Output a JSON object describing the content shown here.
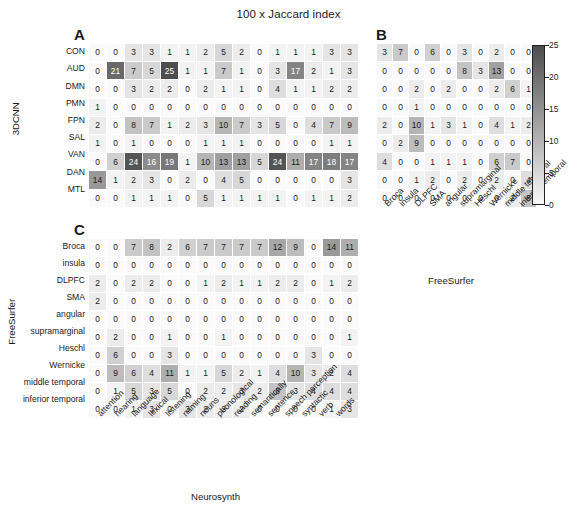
{
  "figure": {
    "title": "100 x Jaccard index"
  },
  "colorbar": {
    "name": "jaccard-colorbar",
    "ticks": [
      "0",
      "5",
      "10",
      "15",
      "20",
      "25"
    ],
    "vmin": 0,
    "vmax": 25,
    "low_color": "#ffffff",
    "high_color": "#4d4d4d"
  },
  "panels": [
    {
      "letter": "A",
      "ylabel": "3DCNN",
      "xlabel": "",
      "rows": [
        "CON",
        "AUD",
        "DMN",
        "PMN",
        "FPN",
        "SAL",
        "VAN",
        "DAN",
        "MTL"
      ],
      "cols": [
        "attention",
        "hearing",
        "language",
        "lexical",
        "listening",
        "naming",
        "nouns",
        "phonological",
        "reading",
        "semantically",
        "sentence",
        "speech perception",
        "syntactic",
        "verb",
        "words"
      ],
      "values": [
        [
          0,
          0,
          3,
          3,
          1,
          1,
          2,
          5,
          2,
          0,
          1,
          1,
          1,
          3,
          3
        ],
        [
          0,
          21,
          7,
          5,
          25,
          1,
          1,
          7,
          1,
          0,
          3,
          17,
          2,
          1,
          3
        ],
        [
          0,
          0,
          3,
          2,
          2,
          0,
          2,
          1,
          1,
          0,
          4,
          1,
          1,
          2,
          2
        ],
        [
          1,
          0,
          0,
          0,
          0,
          0,
          0,
          0,
          0,
          0,
          0,
          0,
          0,
          0,
          0
        ],
        [
          2,
          0,
          8,
          7,
          1,
          2,
          3,
          10,
          7,
          3,
          5,
          0,
          4,
          7,
          9
        ],
        [
          1,
          0,
          1,
          0,
          0,
          0,
          1,
          1,
          1,
          0,
          0,
          0,
          0,
          1,
          1
        ],
        [
          0,
          6,
          24,
          16,
          19,
          1,
          10,
          13,
          13,
          5,
          24,
          11,
          17,
          18,
          17
        ],
        [
          14,
          1,
          2,
          3,
          0,
          2,
          0,
          4,
          5,
          0,
          0,
          0,
          0,
          0,
          3
        ],
        [
          0,
          0,
          1,
          1,
          1,
          0,
          5,
          1,
          1,
          1,
          1,
          0,
          1,
          1,
          2
        ]
      ]
    },
    {
      "letter": "B",
      "ylabel": "",
      "xlabel": "FreeSurfer",
      "rows": [
        "CON",
        "AUD",
        "DMN",
        "PMN",
        "FPN",
        "SAL",
        "VAN",
        "DAN",
        "MTL"
      ],
      "cols": [
        "Broca",
        "insula",
        "DLPFC",
        "SMA",
        "angular",
        "supramarginal",
        "Heschl",
        "Wernicke",
        "middle temporal",
        "inferior temporal"
      ],
      "values": [
        [
          3,
          7,
          0,
          6,
          0,
          3,
          0,
          2,
          0,
          0
        ],
        [
          0,
          0,
          0,
          0,
          0,
          8,
          3,
          13,
          0,
          0
        ],
        [
          0,
          0,
          2,
          0,
          2,
          0,
          0,
          2,
          6,
          1
        ],
        [
          0,
          0,
          1,
          0,
          0,
          0,
          0,
          0,
          0,
          0
        ],
        [
          2,
          0,
          10,
          1,
          3,
          1,
          0,
          4,
          1,
          2
        ],
        [
          0,
          2,
          9,
          0,
          0,
          0,
          0,
          0,
          0,
          0
        ],
        [
          4,
          0,
          0,
          1,
          1,
          1,
          0,
          6,
          7,
          0
        ],
        [
          0,
          0,
          1,
          2,
          0,
          2,
          0,
          2,
          0,
          4
        ],
        [
          0,
          0,
          0,
          0,
          0,
          0,
          0,
          0,
          2,
          8
        ]
      ]
    },
    {
      "letter": "C",
      "ylabel": "FreeSurfer",
      "xlabel": "Neurosynth",
      "rows": [
        "Broca",
        "insula",
        "DLPFC",
        "SMA",
        "angular",
        "supramarginal",
        "Heschl",
        "Wernicke",
        "middle temporal",
        "inferior temporal"
      ],
      "cols": [
        "attention",
        "hearing",
        "language",
        "lexical",
        "listening",
        "naming",
        "nouns",
        "phonological",
        "reading",
        "semantically",
        "sentence",
        "speech perception",
        "syntactic",
        "verb",
        "words"
      ],
      "values": [
        [
          0,
          0,
          7,
          8,
          2,
          6,
          7,
          7,
          7,
          7,
          12,
          9,
          0,
          14,
          11
        ],
        [
          0,
          0,
          0,
          0,
          0,
          0,
          0,
          0,
          0,
          0,
          0,
          0,
          0,
          0,
          0
        ],
        [
          2,
          0,
          2,
          2,
          0,
          0,
          1,
          2,
          1,
          1,
          2,
          2,
          0,
          1,
          2
        ],
        [
          2,
          0,
          0,
          0,
          0,
          0,
          0,
          0,
          0,
          0,
          0,
          0,
          0,
          0,
          0
        ],
        [
          0,
          0,
          0,
          0,
          0,
          0,
          0,
          0,
          0,
          0,
          0,
          0,
          0,
          0,
          0
        ],
        [
          0,
          2,
          0,
          0,
          1,
          0,
          0,
          1,
          0,
          0,
          0,
          0,
          0,
          0,
          1
        ],
        [
          0,
          6,
          0,
          0,
          3,
          0,
          0,
          0,
          0,
          0,
          0,
          0,
          3,
          0,
          0
        ],
        [
          0,
          9,
          6,
          4,
          11,
          1,
          1,
          5,
          2,
          1,
          4,
          10,
          3,
          2,
          4
        ],
        [
          0,
          1,
          5,
          3,
          5,
          0,
          2,
          2,
          3,
          2,
          8,
          3,
          4,
          4,
          4
        ],
        [
          0,
          0,
          1,
          3,
          0,
          3,
          2,
          2,
          2,
          0,
          0,
          0,
          0,
          1,
          3
        ]
      ]
    }
  ],
  "chart_data": {
    "type": "heatmap",
    "title": "100 x Jaccard index",
    "colormap": "greys",
    "zlim": [
      0,
      25
    ],
    "colorbar_ticks": [
      0,
      5,
      10,
      15,
      20,
      25
    ],
    "grid": true,
    "legend_position": "right",
    "panels": [
      {
        "panel": "A",
        "ylabel": "3DCNN",
        "xlabel": "",
        "y": [
          "CON",
          "AUD",
          "DMN",
          "PMN",
          "FPN",
          "SAL",
          "VAN",
          "DAN",
          "MTL"
        ],
        "x": [
          "attention",
          "hearing",
          "language",
          "lexical",
          "listening",
          "naming",
          "nouns",
          "phonological",
          "reading",
          "semantically",
          "sentence",
          "speech perception",
          "syntactic",
          "verb",
          "words"
        ],
        "z": [
          [
            0,
            0,
            3,
            3,
            1,
            1,
            2,
            5,
            2,
            0,
            1,
            1,
            1,
            3,
            3
          ],
          [
            0,
            21,
            7,
            5,
            25,
            1,
            1,
            7,
            1,
            0,
            3,
            17,
            2,
            1,
            3
          ],
          [
            0,
            0,
            3,
            2,
            2,
            0,
            2,
            1,
            1,
            0,
            4,
            1,
            1,
            2,
            2
          ],
          [
            1,
            0,
            0,
            0,
            0,
            0,
            0,
            0,
            0,
            0,
            0,
            0,
            0,
            0,
            0
          ],
          [
            2,
            0,
            8,
            7,
            1,
            2,
            3,
            10,
            7,
            3,
            5,
            0,
            4,
            7,
            9
          ],
          [
            1,
            0,
            1,
            0,
            0,
            0,
            1,
            1,
            1,
            0,
            0,
            0,
            0,
            1,
            1
          ],
          [
            0,
            6,
            24,
            16,
            19,
            1,
            10,
            13,
            13,
            5,
            24,
            11,
            17,
            18,
            17
          ],
          [
            14,
            1,
            2,
            3,
            0,
            2,
            0,
            4,
            5,
            0,
            0,
            0,
            0,
            0,
            3
          ],
          [
            0,
            0,
            1,
            1,
            1,
            0,
            5,
            1,
            1,
            1,
            1,
            0,
            1,
            1,
            2
          ]
        ]
      },
      {
        "panel": "B",
        "ylabel": "3DCNN",
        "xlabel": "FreeSurfer",
        "y": [
          "CON",
          "AUD",
          "DMN",
          "PMN",
          "FPN",
          "SAL",
          "VAN",
          "DAN",
          "MTL"
        ],
        "x": [
          "Broca",
          "insula",
          "DLPFC",
          "SMA",
          "angular",
          "supramarginal",
          "Heschl",
          "Wernicke",
          "middle temporal",
          "inferior temporal"
        ],
        "z": [
          [
            3,
            7,
            0,
            6,
            0,
            3,
            0,
            2,
            0,
            0
          ],
          [
            0,
            0,
            0,
            0,
            0,
            8,
            3,
            13,
            0,
            0
          ],
          [
            0,
            0,
            2,
            0,
            2,
            0,
            0,
            2,
            6,
            1
          ],
          [
            0,
            0,
            1,
            0,
            0,
            0,
            0,
            0,
            0,
            0
          ],
          [
            2,
            0,
            10,
            1,
            3,
            1,
            0,
            4,
            1,
            2
          ],
          [
            0,
            2,
            9,
            0,
            0,
            0,
            0,
            0,
            0,
            0
          ],
          [
            4,
            0,
            0,
            1,
            1,
            1,
            0,
            6,
            7,
            0
          ],
          [
            0,
            0,
            1,
            2,
            0,
            2,
            0,
            2,
            0,
            4
          ],
          [
            0,
            0,
            0,
            0,
            0,
            0,
            0,
            0,
            2,
            8
          ]
        ]
      },
      {
        "panel": "C",
        "ylabel": "FreeSurfer",
        "xlabel": "Neurosynth",
        "y": [
          "Broca",
          "insula",
          "DLPFC",
          "SMA",
          "angular",
          "supramarginal",
          "Heschl",
          "Wernicke",
          "middle temporal",
          "inferior temporal"
        ],
        "x": [
          "attention",
          "hearing",
          "language",
          "lexical",
          "listening",
          "naming",
          "nouns",
          "phonological",
          "reading",
          "semantically",
          "sentence",
          "speech perception",
          "syntactic",
          "verb",
          "words"
        ],
        "z": [
          [
            0,
            0,
            7,
            8,
            2,
            6,
            7,
            7,
            7,
            7,
            12,
            9,
            0,
            14,
            11
          ],
          [
            0,
            0,
            0,
            0,
            0,
            0,
            0,
            0,
            0,
            0,
            0,
            0,
            0,
            0,
            0
          ],
          [
            2,
            0,
            2,
            2,
            0,
            0,
            1,
            2,
            1,
            1,
            2,
            2,
            0,
            1,
            2
          ],
          [
            2,
            0,
            0,
            0,
            0,
            0,
            0,
            0,
            0,
            0,
            0,
            0,
            0,
            0,
            0
          ],
          [
            0,
            0,
            0,
            0,
            0,
            0,
            0,
            0,
            0,
            0,
            0,
            0,
            0,
            0,
            0
          ],
          [
            0,
            2,
            0,
            0,
            1,
            0,
            0,
            1,
            0,
            0,
            0,
            0,
            0,
            0,
            1
          ],
          [
            0,
            6,
            0,
            0,
            3,
            0,
            0,
            0,
            0,
            0,
            0,
            0,
            3,
            0,
            0
          ],
          [
            0,
            9,
            6,
            4,
            11,
            1,
            1,
            5,
            2,
            1,
            4,
            10,
            3,
            2,
            4
          ],
          [
            0,
            1,
            5,
            3,
            5,
            0,
            2,
            2,
            3,
            2,
            8,
            3,
            4,
            4,
            4
          ],
          [
            0,
            0,
            1,
            3,
            0,
            3,
            2,
            2,
            2,
            0,
            0,
            0,
            0,
            1,
            3
          ]
        ]
      }
    ]
  }
}
